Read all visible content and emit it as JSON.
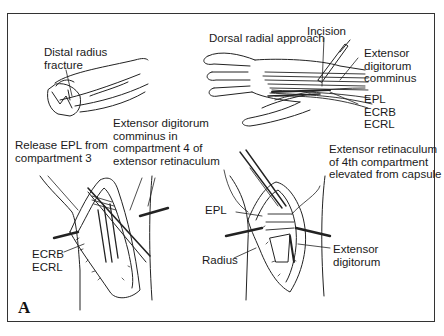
{
  "figure": {
    "panel_letter": "A",
    "border_color": "#333333",
    "line_color": "#222222"
  },
  "panels": {
    "top_left": {
      "title": "Distal radius fracture",
      "labels": [
        {
          "id": "distal-radius-fracture",
          "text": "Distal radius\nfracture"
        }
      ]
    },
    "top_right": {
      "title": "Dorsal radial approach",
      "labels": [
        {
          "id": "dorsal-radial-approach",
          "text": "Dorsal radial approach"
        },
        {
          "id": "incision",
          "text": "Incision"
        },
        {
          "id": "extensor-digitorum-comminus",
          "text": "Extensor\ndigitorum\ncomminus"
        },
        {
          "id": "epl-ecrb-ecrl",
          "text": "EPL\nECRB\nECRL"
        }
      ]
    },
    "bottom_left": {
      "labels": [
        {
          "id": "release-epl",
          "text": "Release EPL from\ncompartment 3"
        },
        {
          "id": "edc-compartment-4",
          "text": "Extensor digitorum\ncomminus in\ncompartment 4 of\nextensor retinaculum"
        },
        {
          "id": "ecrb-ecrl",
          "text": "ECRB\nECRL"
        }
      ]
    },
    "bottom_right": {
      "labels": [
        {
          "id": "extensor-retinaculum-elevated",
          "text": "Extensor retinaculum\nof 4th compartment\nelevated from capsule"
        },
        {
          "id": "epl",
          "text": "EPL"
        },
        {
          "id": "radius",
          "text": "Radius"
        },
        {
          "id": "extensor-digitorum",
          "text": "Extensor\ndigitorum"
        }
      ]
    }
  }
}
